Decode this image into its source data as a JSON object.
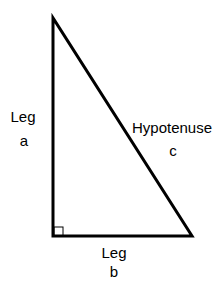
{
  "diagram": {
    "stroke_color": "#000000",
    "vertices": {
      "top": [
        53,
        18
      ],
      "right_angle": [
        53,
        236
      ],
      "bottom_right": [
        192,
        236
      ]
    },
    "labels": {
      "leg_a": {
        "line1": "Leg",
        "line2": "a"
      },
      "hypotenuse": {
        "line1": "Hypotenuse",
        "line2": "c"
      },
      "leg_b": {
        "line1": "Leg",
        "line2": "b"
      }
    }
  }
}
